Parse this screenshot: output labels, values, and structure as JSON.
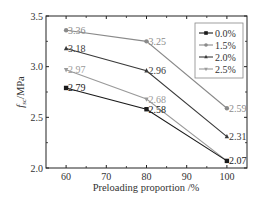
{
  "chart_data": {
    "type": "line",
    "title": "",
    "xlabel": "Preloading proportion /%",
    "ylabel": "f_sc/MPa",
    "ylabel_main": "f",
    "ylabel_sub": "sc",
    "ylabel_unit": "/MPa",
    "x": [
      60,
      80,
      100
    ],
    "xlim": [
      55,
      105
    ],
    "ylim": [
      2.0,
      3.5
    ],
    "xticks": [
      60,
      70,
      80,
      90,
      100
    ],
    "yticks": [
      2.0,
      2.5,
      3.0,
      3.5
    ],
    "ytick_labels": [
      "2.0",
      "2.5",
      "3.0",
      "3.5"
    ],
    "grid": false,
    "legend_position": "upper right",
    "series": [
      {
        "name": "0.0%",
        "values": [
          2.79,
          2.58,
          2.07
        ],
        "labels": [
          "2.79",
          "2.58",
          "2.07"
        ],
        "color": "#1a1a1a",
        "marker": "square",
        "label_color": "#1a1a1a"
      },
      {
        "name": "1.5%",
        "values": [
          3.36,
          3.25,
          2.59
        ],
        "labels": [
          "3.36",
          "3.25",
          "2.59"
        ],
        "color": "#8a8a8a",
        "marker": "circle",
        "label_color": "#8a8a8a"
      },
      {
        "name": "2.0%",
        "values": [
          3.18,
          2.96,
          2.31
        ],
        "labels": [
          "3.18",
          "2.96",
          "2.31"
        ],
        "color": "#3a3a3a",
        "marker": "triangle-up",
        "label_color": "#3a3a3a"
      },
      {
        "name": "2.5%",
        "values": [
          2.97,
          2.68,
          2.07
        ],
        "labels": [
          "2.97",
          "2.68",
          ""
        ],
        "color": "#9a9a9a",
        "marker": "triangle-down",
        "label_color": "#9a9a9a"
      }
    ]
  }
}
